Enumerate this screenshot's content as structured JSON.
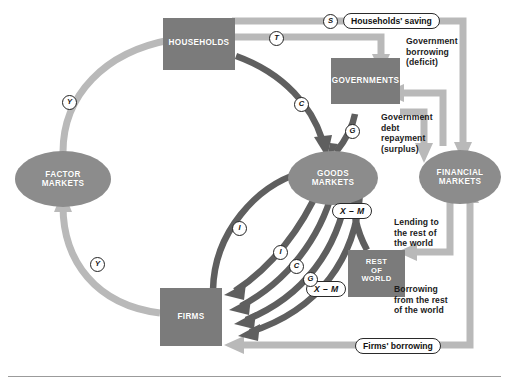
{
  "figure": {
    "type": "circular-flow-diagram",
    "background": "#ffffff",
    "bottom_rule_color": "#9b9b9b"
  },
  "palette": {
    "node_fill_dark": "#7b7b7b",
    "node_fill_mid": "#8c8c8c",
    "arrow_dark": "#5f5f5f",
    "arrow_light": "#b9b9b9",
    "arrow_outline": "#ffffff",
    "text_dark": "#1b1b1b",
    "text_on_node": "#ffffff",
    "badge_stroke": "#232323"
  },
  "nodes": {
    "households": {
      "label": "HOUSEHOLDS",
      "shape": "rect"
    },
    "governments": {
      "label": "GOVERNMENTS",
      "shape": "rect"
    },
    "firms": {
      "label": "FIRMS",
      "shape": "rect"
    },
    "rest_of_world": {
      "label_line1": "REST",
      "label_line2": "OF",
      "label_line3": "WORLD",
      "shape": "rect"
    },
    "factor_markets": {
      "label_line1": "FACTOR",
      "label_line2": "MARKETS",
      "shape": "ellipse"
    },
    "goods_markets": {
      "label_line1": "GOODS",
      "label_line2": "MARKETS",
      "shape": "ellipse"
    },
    "financial_markets": {
      "label_line1": "FINANCIAL",
      "label_line2": "MARKETS",
      "shape": "ellipse"
    }
  },
  "badges": {
    "s": "S",
    "t": "T",
    "c_top": "C",
    "g_gov": "G",
    "y_left_upper": "Y",
    "y_left_lower": "Y",
    "i_outer": "I",
    "i_inner": "I",
    "c_bundle": "C",
    "g_bundle": "G"
  },
  "pills": {
    "households_saving": "Households' saving",
    "firms_borrowing": "Firms' borrowing",
    "xm_upper": "X – M",
    "xm_lower": "X – M"
  },
  "captions": {
    "government_borrowing": "Government\nborrowing\n(deficit)",
    "government_debt_repayment": "Government\ndebt\nrepayment\n(surplus)",
    "lending_to_row": "Lending to\nthe rest of\nthe world",
    "borrowing_from_row": "Borrowing\nfrom the rest\nof the world"
  },
  "flows": [
    {
      "name": "factor-markets-to-households",
      "symbol": "Y",
      "from": "factor_markets",
      "to": "households",
      "tone": "light"
    },
    {
      "name": "firms-to-factor-markets",
      "symbol": "Y",
      "from": "firms",
      "to": "factor_markets",
      "tone": "light"
    },
    {
      "name": "households-consumption-to-goods-markets",
      "symbol": "C",
      "from": "households",
      "to": "goods_markets",
      "tone": "dark"
    },
    {
      "name": "households-saving-to-financial-markets",
      "symbol": "S",
      "from": "households",
      "to": "financial_markets",
      "tone": "light"
    },
    {
      "name": "households-taxes-to-governments",
      "symbol": "T",
      "from": "households",
      "to": "governments",
      "tone": "light"
    },
    {
      "name": "government-expenditure-to-goods-markets",
      "symbol": "G",
      "from": "governments",
      "to": "goods_markets",
      "tone": "dark"
    },
    {
      "name": "government-borrowing-deficit",
      "symbol": "",
      "from": "financial_markets",
      "to": "governments",
      "tone": "light"
    },
    {
      "name": "government-debt-repayment-surplus",
      "symbol": "",
      "from": "governments",
      "to": "financial_markets",
      "tone": "light"
    },
    {
      "name": "investment-to-firms",
      "symbol": "I",
      "from": "goods_markets",
      "to": "firms",
      "tone": "dark"
    },
    {
      "name": "consumption-to-firms",
      "symbol": "C",
      "from": "goods_markets",
      "to": "firms",
      "tone": "dark"
    },
    {
      "name": "government-expenditure-to-firms",
      "symbol": "G",
      "from": "goods_markets",
      "to": "firms",
      "tone": "dark"
    },
    {
      "name": "net-exports-to-firms",
      "symbol": "X – M",
      "from": "goods_markets",
      "to": "firms",
      "tone": "dark"
    },
    {
      "name": "firms-investment-to-goods-markets",
      "symbol": "I",
      "from": "firms",
      "to": "goods_markets",
      "tone": "dark"
    },
    {
      "name": "net-exports-row-to-goods-markets",
      "symbol": "X – M",
      "from": "rest_of_world",
      "to": "goods_markets",
      "tone": "dark"
    },
    {
      "name": "lending-to-rest-of-world",
      "symbol": "",
      "from": "financial_markets",
      "to": "rest_of_world",
      "tone": "light"
    },
    {
      "name": "borrowing-from-rest-of-world",
      "symbol": "",
      "from": "rest_of_world",
      "to": "financial_markets",
      "tone": "light"
    },
    {
      "name": "firms-borrowing-from-financial-markets",
      "symbol": "",
      "from": "financial_markets",
      "to": "firms",
      "tone": "light"
    }
  ]
}
